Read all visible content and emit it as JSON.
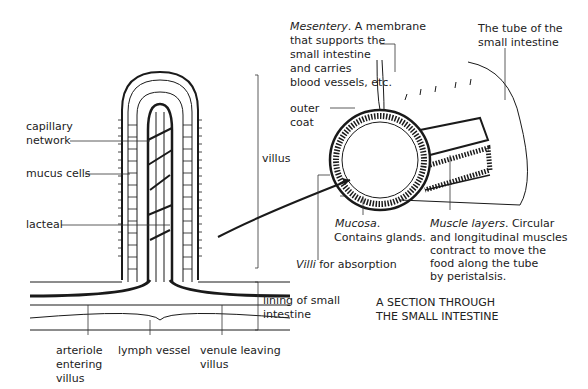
{
  "diagram": {
    "title_line1": "A SECTION THROUGH",
    "title_line2": "THE SMALL INTESTINE",
    "villus_labels": {
      "capillary_network_1": "capillary",
      "capillary_network_2": "network",
      "mucus_cells": "mucus cells",
      "lacteal": "lacteal",
      "villus": "villus",
      "lining_1": "lining of small",
      "lining_2": "intestine",
      "arteriole_1": "arteriole",
      "arteriole_2": "entering",
      "arteriole_3": "villus",
      "lymph_vessel": "lymph vessel",
      "venule_1": "venule leaving",
      "venule_2": "villus"
    },
    "section_labels": {
      "mesentery_title": "Mesentery",
      "mesentery_1": ". A membrane",
      "mesentery_2": "that supports the",
      "mesentery_3": "small intestine",
      "mesentery_4": "and carries",
      "mesentery_5": "blood vessels, etc.",
      "tube_1": "The tube of the",
      "tube_2": "small intestine",
      "outer_coat_1": "outer",
      "outer_coat_2": "coat",
      "mucosa_title": "Mucosa",
      "mucosa_1": ".",
      "mucosa_2": "Contains glands.",
      "villi_title": "Villi",
      "villi_1": " for absorption",
      "muscle_title": "Muscle layers",
      "muscle_1": ". Circular",
      "muscle_2": "and longitudinal muscles",
      "muscle_3": "contract to move the",
      "muscle_4": "food along the tube",
      "muscle_5": "by peristalsis."
    }
  }
}
